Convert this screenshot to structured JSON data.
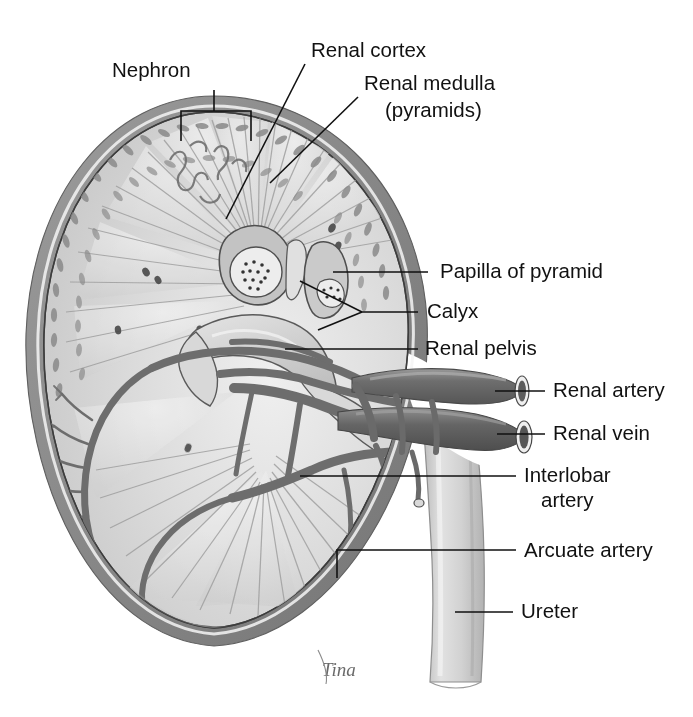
{
  "figure": {
    "signature": "Tina",
    "background_color": "#ffffff",
    "ink_color": "#111111"
  },
  "colors": {
    "capsule": "#8d8d8d",
    "capsule_dark": "#6f6f6f",
    "cortex": "#d2d2d2",
    "cortex_light": "#e3e3e3",
    "medulla": "#b4b4b4",
    "medulla_dark": "#9a9a9a",
    "pelvis": "#cfcfcf",
    "pelvis_light": "#dedede",
    "vessel_dark": "#6b6b6b",
    "vessel_mid": "#848484",
    "vessel_light": "#9d9d9d",
    "ureter": "#d5d5d5",
    "ureter_shade": "#bcbcbc",
    "outline": "#3a3a3a"
  },
  "labels": [
    {
      "id": "nephron",
      "text": "Nephron",
      "x": 112,
      "y": 77,
      "anchor": "start",
      "leader": "bracket"
    },
    {
      "id": "renal-cortex",
      "text": "Renal cortex",
      "x": 311,
      "y": 57,
      "anchor": "start",
      "leader": "line"
    },
    {
      "id": "renal-medulla",
      "text": "Renal medulla",
      "x": 364,
      "y": 90,
      "anchor": "start",
      "leader": "line"
    },
    {
      "id": "renal-medulla-sub",
      "text": "(pyramids)",
      "x": 385,
      "y": 117,
      "anchor": "start",
      "leader": "none"
    },
    {
      "id": "papilla-of-pyramid",
      "text": "Papilla of pyramid",
      "x": 440,
      "y": 278,
      "anchor": "start",
      "leader": "line"
    },
    {
      "id": "calyx",
      "text": "Calyx",
      "x": 427,
      "y": 318,
      "anchor": "start",
      "leader": "fork"
    },
    {
      "id": "renal-pelvis",
      "text": "Renal pelvis",
      "x": 425,
      "y": 355,
      "anchor": "start",
      "leader": "line"
    },
    {
      "id": "renal-artery",
      "text": "Renal artery",
      "x": 553,
      "y": 397,
      "anchor": "start",
      "leader": "line"
    },
    {
      "id": "renal-vein",
      "text": "Renal vein",
      "x": 553,
      "y": 440,
      "anchor": "start",
      "leader": "line"
    },
    {
      "id": "interlobar-artery",
      "text": "Interlobar",
      "x": 524,
      "y": 482,
      "anchor": "start",
      "leader": "line"
    },
    {
      "id": "interlobar-artery-sub",
      "text": "artery",
      "x": 541,
      "y": 507,
      "anchor": "start",
      "leader": "none"
    },
    {
      "id": "arcuate-artery",
      "text": "Arcuate artery",
      "x": 524,
      "y": 557,
      "anchor": "start",
      "leader": "elbow"
    },
    {
      "id": "ureter",
      "text": "Ureter",
      "x": 521,
      "y": 618,
      "anchor": "start",
      "leader": "line"
    }
  ],
  "leaders": {
    "renal-cortex": "M 305 64 L 226 219",
    "renal-medulla": "M 358 97 L 270 183",
    "papilla-of-pyramid": "M 428 272 L 333 272",
    "calyx-main": "M 418 312 L 362 312",
    "calyx-fork-a": "M 362 312 L 300 281",
    "calyx-fork-b": "M 362 312 L 318 330",
    "renal-pelvis": "M 418 349 L 285 349",
    "renal-artery": "M 545 391 L 495 391",
    "renal-vein": "M 545 434 L 497 434",
    "interlobar-artery": "M 516 476 L 300 476",
    "arcuate-artery": "M 516 550 L 337 550 L 337 578",
    "ureter": "M 513 612 L 455 612",
    "nephron-bracket": "M 181 141 L 181 111 L 251 111 L 251 141",
    "nephron-stem": "M 214 90 L 214 111"
  }
}
